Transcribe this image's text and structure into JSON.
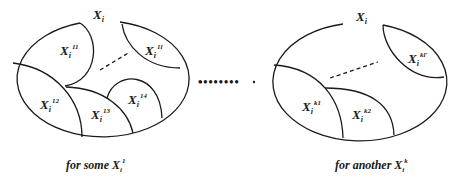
{
  "diagram": {
    "stroke_color": "#1a1a1a",
    "left_set": {
      "title": {
        "base": "X",
        "sub": "i"
      },
      "regions": [
        {
          "base": "X",
          "sub": "i",
          "sup": "11"
        },
        {
          "base": "X",
          "sub": "i",
          "sup": "1l"
        },
        {
          "base": "X",
          "sub": "i",
          "sup": "12"
        },
        {
          "base": "X",
          "sub": "i",
          "sup": "13"
        },
        {
          "base": "X",
          "sub": "i",
          "sup": "14"
        }
      ],
      "caption": {
        "prefix": "for some ",
        "base": "X",
        "sub": "i",
        "sup": "1"
      }
    },
    "separator": "••••••••",
    "right_set": {
      "title": {
        "base": "X",
        "sub": "i"
      },
      "regions": [
        {
          "base": "X",
          "sub": "i",
          "sup": "kl'"
        },
        {
          "base": "X",
          "sub": "i",
          "sup": "k1"
        },
        {
          "base": "X",
          "sub": "i",
          "sup": "k2"
        }
      ],
      "caption": {
        "prefix": "for another ",
        "base": "X",
        "sub": "i",
        "sup": "k"
      }
    }
  }
}
